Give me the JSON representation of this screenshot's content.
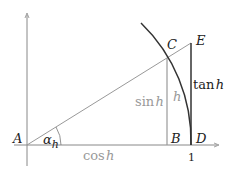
{
  "diagram": {
    "type": "unit-circle-trig",
    "points": {
      "A": "A",
      "B": "B",
      "C": "C",
      "D": "D",
      "E": "E"
    },
    "labels": {
      "angle_symbol": "α",
      "angle_subscript": "h",
      "cos_fn": "cos",
      "sin_fn": "sin",
      "tan_fn": "tan",
      "var": "h",
      "arc_label": "h",
      "unit_tick": "1"
    },
    "colors": {
      "axis": "#888888",
      "line": "#999999",
      "dark": "#333333",
      "gray_text": "#999999"
    }
  }
}
